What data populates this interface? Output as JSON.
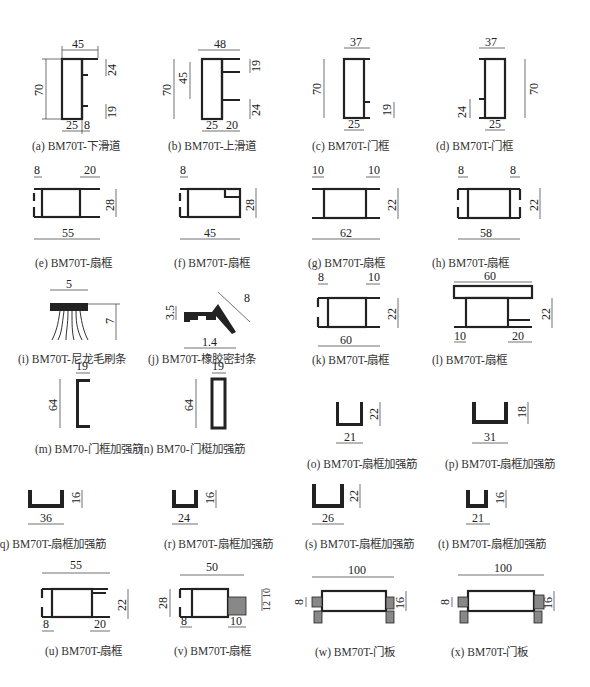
{
  "figures": [
    {
      "id": "a",
      "caption": "(a) BM70T-下滑道",
      "dims": {
        "width": "45",
        "height": "70",
        "top_right": "24",
        "bottom_right": "19",
        "bottom_left": "25",
        "bottom_mid": "8"
      }
    },
    {
      "id": "b",
      "caption": "(b) BM70T-上滑道",
      "dims": {
        "width": "48",
        "height": "70",
        "inner": "45",
        "top_right": "19",
        "bottom_right": "24",
        "bottom_left": "25",
        "bottom_mid": "20"
      }
    },
    {
      "id": "c",
      "caption": "(c) BM70T-门框",
      "dims": {
        "width": "37",
        "height": "70",
        "right": "19",
        "bottom": "25"
      }
    },
    {
      "id": "d",
      "caption": "(d) BM70T-门框",
      "dims": {
        "width": "37",
        "height": "70",
        "left": "24",
        "bottom": "25"
      }
    },
    {
      "id": "e",
      "caption": "(e) BM70T-扇框",
      "dims": {
        "left": "8",
        "right": "20",
        "height": "28",
        "width": "55"
      }
    },
    {
      "id": "f",
      "caption": "(f) BM70T-扇框",
      "dims": {
        "left": "8",
        "height": "28",
        "width": "45"
      }
    },
    {
      "id": "g",
      "caption": "(g) BM70T-扇框",
      "dims": {
        "left": "10",
        "right": "10",
        "height": "22",
        "width": "62"
      }
    },
    {
      "id": "h",
      "caption": "(h) BM70T-扇框",
      "dims": {
        "left": "8",
        "right": "8",
        "height": "22",
        "width": "58"
      }
    },
    {
      "id": "i",
      "caption": "(i) BM70T-尼龙毛刷条",
      "dims": {
        "width": "5",
        "height": "7"
      }
    },
    {
      "id": "j",
      "caption": "(j) BM70T-橡胶密封条",
      "dims": {
        "height": "3.5",
        "diag": "8",
        "width": "1.4"
      }
    },
    {
      "id": "k",
      "caption": "(k) BM70T-扇框",
      "dims": {
        "left": "8",
        "right": "10",
        "height": "22",
        "width": "60"
      }
    },
    {
      "id": "l",
      "caption": "(l) BM70T-扇框",
      "dims": {
        "width": "60",
        "height": "22",
        "bottom_left": "10",
        "bottom_right": "20"
      }
    },
    {
      "id": "m",
      "caption": "(m) BM70-门框加强筋",
      "dims": {
        "width": "19",
        "height": "64"
      }
    },
    {
      "id": "n",
      "caption": "(n) BM70-门梃加强筋",
      "dims": {
        "width": "19",
        "height": "64"
      }
    },
    {
      "id": "o",
      "caption": "(o) BM70T-扇框加强筋",
      "dims": {
        "width": "21",
        "height": "22"
      }
    },
    {
      "id": "p",
      "caption": "(p) BM70T-扇框加强筋",
      "dims": {
        "width": "31",
        "height": "18"
      }
    },
    {
      "id": "q",
      "caption": "(q) BM70T-扇框加强筋",
      "dims": {
        "width": "36",
        "height": "16"
      }
    },
    {
      "id": "r",
      "caption": "(r) BM70T-扇框加强筋",
      "dims": {
        "width": "24",
        "height": "16"
      }
    },
    {
      "id": "s",
      "caption": "(s) BM70T-扇框加强筋",
      "dims": {
        "width": "26",
        "height": "22"
      }
    },
    {
      "id": "t",
      "caption": "(t) BM70T-扇框加强筋",
      "dims": {
        "width": "21",
        "height": "16"
      }
    },
    {
      "id": "u",
      "caption": "(u) BM70T-扇框",
      "dims": {
        "width": "55",
        "height": "22",
        "bottom_left": "8",
        "bottom_right": "20"
      }
    },
    {
      "id": "v",
      "caption": "(v) BM70T-扇框",
      "dims": {
        "width": "50",
        "height": "28",
        "right_top": "10",
        "right_bottom": "12",
        "bottom_left": "8",
        "bottom_right": "10"
      }
    },
    {
      "id": "w",
      "caption": "(w) BM70T-门板",
      "dims": {
        "width": "100",
        "height": "16",
        "left": "8",
        "foot": "8"
      }
    },
    {
      "id": "x",
      "caption": "(x) BM70T-门板",
      "dims": {
        "width": "100",
        "height": "16",
        "left": "8",
        "foot": "8"
      }
    }
  ]
}
